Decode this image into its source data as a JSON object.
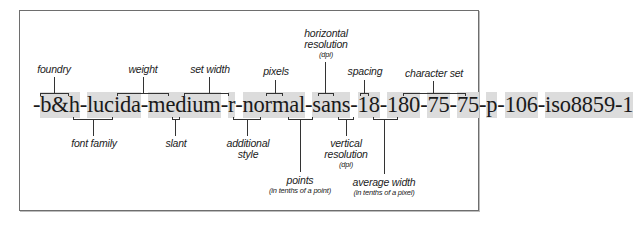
{
  "diagram": {
    "segments": [
      {
        "id": "foundry",
        "text": "b&h",
        "highlight": true
      },
      {
        "id": "family",
        "text": "lucida",
        "highlight": true
      },
      {
        "id": "weight",
        "text": "medium",
        "highlight": true
      },
      {
        "id": "slant",
        "text": "r",
        "highlight": true
      },
      {
        "id": "setwidth",
        "text": "normal",
        "highlight": true
      },
      {
        "id": "addstyle",
        "text": "sans",
        "highlight": true
      },
      {
        "id": "pixels",
        "text": "18",
        "highlight": true
      },
      {
        "id": "points",
        "text": "180",
        "highlight": true
      },
      {
        "id": "hres",
        "text": "75",
        "highlight": true
      },
      {
        "id": "vres",
        "text": "75",
        "highlight": true
      },
      {
        "id": "spacing",
        "text": "p",
        "highlight": true
      },
      {
        "id": "avgwidth",
        "text": "106",
        "highlight": true
      },
      {
        "id": "charset",
        "text": "iso8859-1",
        "highlight": true
      }
    ],
    "separator": "-",
    "labels_top": {
      "foundry": "foundry",
      "weight": "weight",
      "setwidth": "set width",
      "pixels": "pixels",
      "hres_line1": "horizontal",
      "hres_line2": "resolution",
      "hres_unit": "(dpi)",
      "spacing": "spacing",
      "charset": "character set"
    },
    "labels_bottom": {
      "family": "font family",
      "slant": "slant",
      "addstyle_line1": "additional",
      "addstyle_line2": "style",
      "points": "points",
      "points_unit": "(in tenths of a point)",
      "vres_line1": "vertical",
      "vres_line2": "resolution",
      "vres_unit": "(dpi)",
      "avgwidth": "average width",
      "avgwidth_unit": "(in tenths of a pixel)"
    },
    "colors": {
      "highlight": "#dcdcdc",
      "text": "#1a1a1a",
      "lines": "#333333",
      "frame": "#6e6e6e"
    }
  }
}
